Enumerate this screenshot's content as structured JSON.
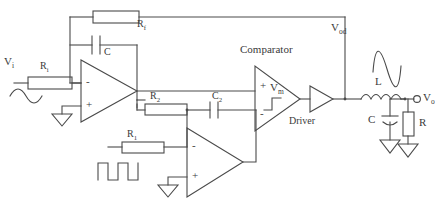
{
  "diagram": {
    "stroke_color": "#4a4a4a",
    "background_color": "#ffffff",
    "labels": {
      "vi": "V",
      "vi_sub": "i",
      "ri": "R",
      "ri_sub": "i",
      "rf": "R",
      "rf_sub": "f",
      "c": "C",
      "r2": "R",
      "r2_sub": "2",
      "r1": "R",
      "r1_sub": "1",
      "c2": "C",
      "c2_sub": "2",
      "comparator": "Comparator",
      "vm": "V",
      "vm_sub": "m",
      "driver": "Driver",
      "vod": "V",
      "vod_sub": "od",
      "l": "L",
      "cout": "C",
      "rout": "R",
      "vo": "V",
      "vo_sub": "o",
      "opamp_minus": "-",
      "opamp_plus": "+"
    },
    "components": [
      {
        "name": "input-source-sine",
        "type": "sine-wave-source",
        "label": "V_i"
      },
      {
        "name": "resistor-ri",
        "type": "resistor",
        "label": "R_i"
      },
      {
        "name": "resistor-rf",
        "type": "resistor",
        "label": "R_f"
      },
      {
        "name": "capacitor-c",
        "type": "capacitor",
        "label": "C"
      },
      {
        "name": "opamp-integrator",
        "type": "opamp",
        "inputs": [
          "-",
          "+"
        ]
      },
      {
        "name": "resistor-r2",
        "type": "resistor",
        "label": "R_2"
      },
      {
        "name": "capacitor-c2",
        "type": "capacitor",
        "label": "C_2"
      },
      {
        "name": "resistor-r1",
        "type": "resistor",
        "label": "R_1"
      },
      {
        "name": "opamp-triangle-generator",
        "type": "opamp",
        "inputs": [
          "-",
          "+"
        ]
      },
      {
        "name": "square-wave-source",
        "type": "square-wave-source"
      },
      {
        "name": "comparator",
        "type": "comparator",
        "label": "Comparator",
        "output": "V_m"
      },
      {
        "name": "driver",
        "type": "buffer",
        "label": "Driver"
      },
      {
        "name": "inductor-l",
        "type": "inductor",
        "label": "L"
      },
      {
        "name": "capacitor-cout",
        "type": "capacitor",
        "label": "C"
      },
      {
        "name": "resistor-rout",
        "type": "resistor",
        "label": "R"
      },
      {
        "name": "output-terminal-vo",
        "type": "terminal",
        "label": "V_o"
      },
      {
        "name": "output-sine-waveform",
        "type": "sine-wave"
      }
    ]
  }
}
